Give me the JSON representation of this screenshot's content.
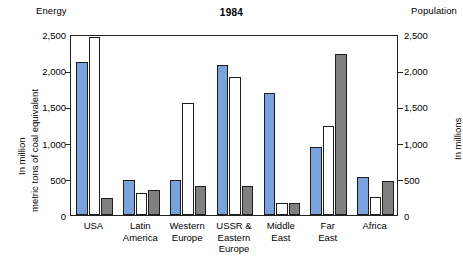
{
  "chart_data": {
    "type": "bar",
    "title": "1984",
    "left_axis_header": "Energy",
    "right_axis_header": "Population",
    "ylabel_left_line1": "In million",
    "ylabel_left_line2": "metric tons of coal equivalent",
    "ylabel_right": "In millions",
    "xlabel": "",
    "ylim": [
      0,
      2500
    ],
    "yticks": [
      0,
      500,
      1000,
      1500,
      2000,
      2500
    ],
    "ytick_labels": [
      "0",
      "500",
      "1,000",
      "1,500",
      "2,000",
      "2,500"
    ],
    "ytick_labels_right": [
      "0",
      "500",
      "1,000",
      "1,500",
      "2,000",
      "2,500"
    ],
    "grid": false,
    "legend": [],
    "categories": [
      "USA",
      "Latin America",
      "Western Europe",
      "USSR & Eastern Europe",
      "Middle East",
      "Far East",
      "Africa"
    ],
    "category_lines": [
      [
        "USA"
      ],
      [
        "Latin",
        "America"
      ],
      [
        "Western",
        "Europe"
      ],
      [
        "USSR &",
        "Eastern",
        "Europe"
      ],
      [
        "Middle",
        "East"
      ],
      [
        "Far",
        "East"
      ],
      [
        "Africa"
      ]
    ],
    "series": [
      {
        "name": "blue",
        "color": "#7aa3dd",
        "values": [
          2120,
          485,
          480,
          2070,
          1680,
          935,
          530
        ]
      },
      {
        "name": "white",
        "color": "#ffffff",
        "values": [
          2460,
          305,
          1545,
          1900,
          165,
          1235,
          245
        ]
      },
      {
        "name": "gray",
        "color": "#808080",
        "values": [
          230,
          345,
          395,
          400,
          170,
          2225,
          465
        ]
      }
    ]
  }
}
